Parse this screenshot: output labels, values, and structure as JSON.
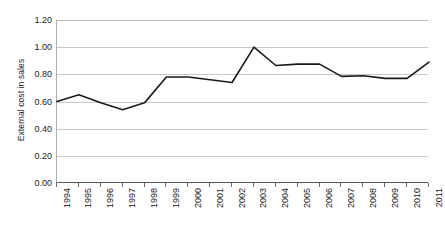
{
  "chart_data": {
    "type": "line",
    "title": "",
    "xlabel": "",
    "ylabel": "External cost in sales",
    "categories": [
      "1994",
      "1995",
      "1996",
      "1997",
      "1998",
      "1999",
      "2000",
      "2001",
      "2002",
      "2003",
      "2004",
      "2005",
      "2006",
      "2007",
      "2008",
      "2009",
      "2010",
      "2011"
    ],
    "values": [
      0.6,
      0.65,
      0.59,
      0.54,
      0.59,
      0.78,
      0.78,
      0.76,
      0.74,
      1.0,
      0.865,
      0.875,
      0.875,
      0.785,
      0.79,
      0.77,
      0.77,
      0.89
    ],
    "series": [
      {
        "name": "External cost in sales",
        "values": [
          0.6,
          0.65,
          0.59,
          0.54,
          0.59,
          0.78,
          0.78,
          0.76,
          0.74,
          1.0,
          0.865,
          0.875,
          0.875,
          0.785,
          0.79,
          0.77,
          0.77,
          0.89
        ]
      }
    ],
    "ylim": [
      0.0,
      1.2
    ],
    "y_ticks": [
      "0.00",
      "0.20",
      "0.40",
      "0.60",
      "0.80",
      "1.00",
      "1.20"
    ],
    "y_tick_values": [
      0.0,
      0.2,
      0.4,
      0.6,
      0.8,
      1.0,
      1.2
    ],
    "grid": true,
    "legend": "none",
    "line_color": "#1a1a1a",
    "grid_color": "#c8c8c8",
    "axis_color": "#5a5a5a",
    "background_color": "#ffffff"
  },
  "axis": {
    "y_title": "External cost in sales"
  }
}
